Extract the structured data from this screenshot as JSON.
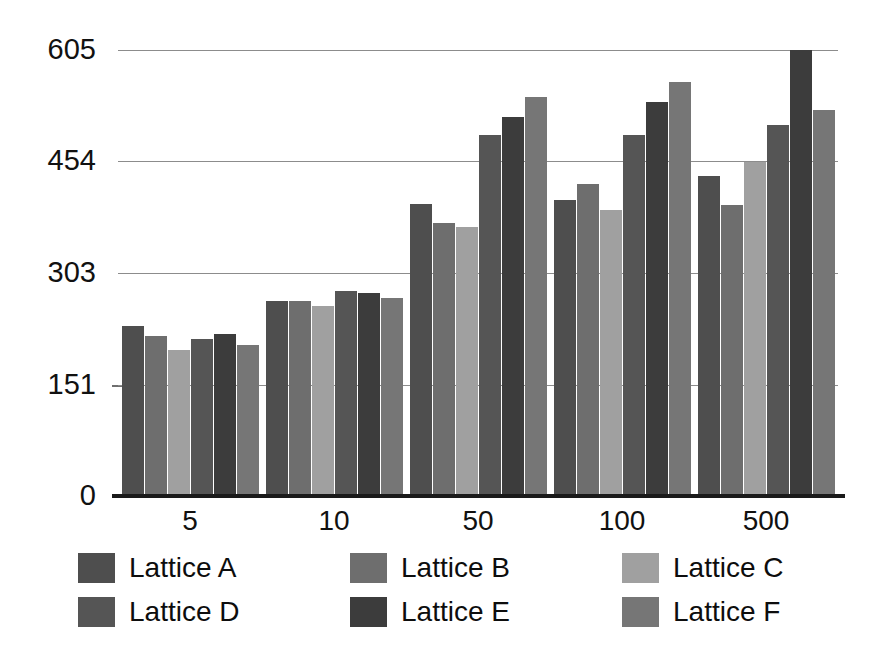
{
  "chart_data": {
    "type": "bar",
    "title": "",
    "subtitle": "",
    "xlabel": "",
    "ylabel": "",
    "categories": [
      "5",
      "10",
      "50",
      "100",
      "500"
    ],
    "ylim": [
      0,
      605
    ],
    "yticks": [
      0,
      151,
      303,
      454,
      605
    ],
    "ytick_labels": [
      "0",
      "151",
      "303",
      "454",
      "605"
    ],
    "grid": "horizontal",
    "legend_position": "bottom",
    "orientation": "vertical",
    "series": [
      {
        "name": "Lattice A",
        "color": "#4e4e4e",
        "values": [
          230,
          265,
          396,
          401,
          434
        ]
      },
      {
        "name": "Lattice B",
        "color": "#6e6e6e",
        "values": [
          217,
          265,
          371,
          423,
          395
        ]
      },
      {
        "name": "Lattice C",
        "color": "#a0a0a0",
        "values": [
          198,
          258,
          365,
          388,
          453
        ]
      },
      {
        "name": "Lattice D",
        "color": "#555555",
        "values": [
          213,
          278,
          490,
          490,
          503
        ]
      },
      {
        "name": "Lattice E",
        "color": "#3c3c3c",
        "values": [
          220,
          275,
          514,
          534,
          605
        ]
      },
      {
        "name": "Lattice F",
        "color": "#767676",
        "values": [
          205,
          269,
          541,
          562,
          523
        ]
      }
    ]
  },
  "legend": {
    "entries": [
      {
        "label": "Lattice A",
        "swatch": "#4e4e4e"
      },
      {
        "label": "Lattice B",
        "swatch": "#6e6e6e"
      },
      {
        "label": "Lattice C",
        "swatch": "#a0a0a0"
      },
      {
        "label": "Lattice D",
        "swatch": "#555555"
      },
      {
        "label": "Lattice E",
        "swatch": "#3c3c3c"
      },
      {
        "label": "Lattice F",
        "swatch": "#767676"
      }
    ]
  },
  "style": {
    "background": "#ffffff",
    "gridline_color": "#8c8c8c",
    "axis_color": "#1a1a1a",
    "text_color": "#111111"
  }
}
